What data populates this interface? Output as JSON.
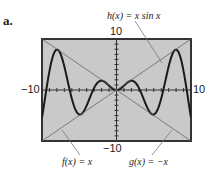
{
  "part_label": "a.",
  "chart_data": {
    "type": "line",
    "title": "",
    "xlabel": "",
    "ylabel": "",
    "xlim": [
      -10,
      10
    ],
    "ylim": [
      -10,
      10
    ],
    "grid": false,
    "tick_labels": {
      "x_min": "−10",
      "x_max": "10",
      "y_min": "−10",
      "y_max": "10"
    },
    "series": [
      {
        "name": "h(x) = x sin x",
        "expr": "x*sin(x)",
        "style": "thick dark"
      },
      {
        "name": "f(x) = x",
        "expr": "x",
        "style": "thin gray"
      },
      {
        "name": "g(x) = −x",
        "expr": "-x",
        "style": "thin gray"
      }
    ],
    "annotations": [
      "h(x) = x sin x",
      "f(x) = x",
      "g(x) = −x"
    ],
    "background": "#c9c9c9"
  },
  "labels": {
    "h": "h(x) = x sin x",
    "f": "f(x) = x",
    "g": "g(x) = −x",
    "ymax": "10",
    "ymin": "−10",
    "xmin": "−10",
    "xmax": "10"
  }
}
